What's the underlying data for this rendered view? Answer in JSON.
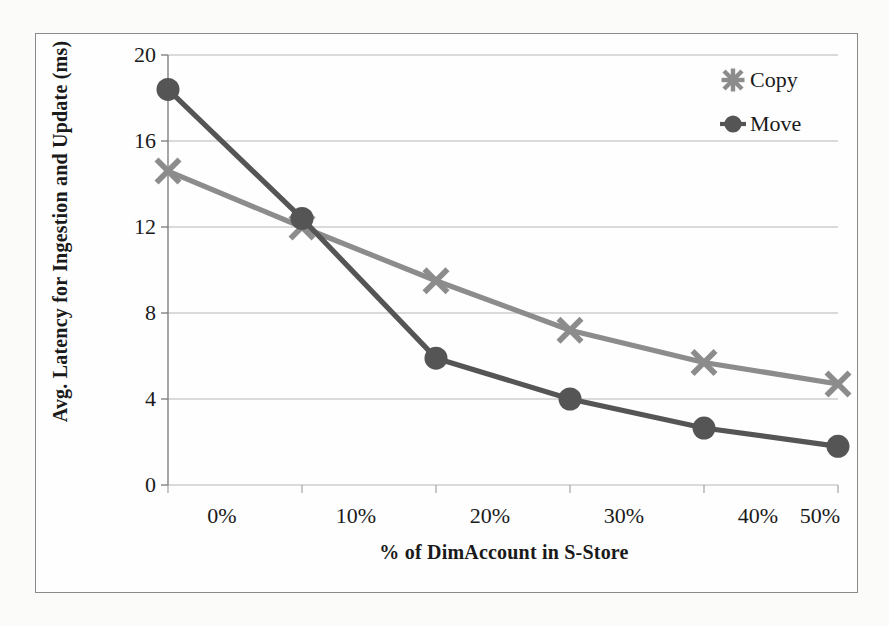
{
  "chart_data": {
    "type": "line",
    "title": "",
    "xlabel": "% of DimAccount in S-Store",
    "ylabel": "Avg. Latency for Ingestion and Update (ms)",
    "categories": [
      "0%",
      "10%",
      "20%",
      "30%",
      "40%",
      "50%"
    ],
    "x": [
      0,
      10,
      20,
      30,
      40,
      50
    ],
    "xlim": [
      0,
      50
    ],
    "ylim": [
      0,
      20
    ],
    "yticks": [
      0,
      4,
      8,
      12,
      16,
      20
    ],
    "ytick_labels": [
      "0",
      "4",
      "8",
      "12",
      "16",
      "20"
    ],
    "grid": true,
    "legend_position": "top-right",
    "series": [
      {
        "name": "Copy",
        "marker": "x-cross",
        "color": "#8c8c8c",
        "values": [
          14.6,
          12.0,
          9.5,
          7.2,
          5.7,
          4.7
        ]
      },
      {
        "name": "Move",
        "marker": "circle",
        "color": "#555555",
        "values": [
          18.4,
          12.4,
          5.9,
          4.0,
          2.65,
          1.8
        ]
      }
    ]
  },
  "axes": {
    "y_title": "Avg. Latency for Ingestion and Update (ms)",
    "x_title": "% of DimAccount in S-Store"
  },
  "legend": {
    "items": [
      {
        "label": "Copy",
        "marker": "x-cross-icon",
        "color": "#8c8c8c"
      },
      {
        "label": "Move",
        "marker": "circle-icon",
        "color": "#555555"
      }
    ]
  },
  "colors": {
    "copy_series": "#8c8c8c",
    "move_series": "#555555",
    "gridline": "#b5b5b5",
    "frame": "#8a8a8a",
    "text": "#1a1a1a"
  }
}
